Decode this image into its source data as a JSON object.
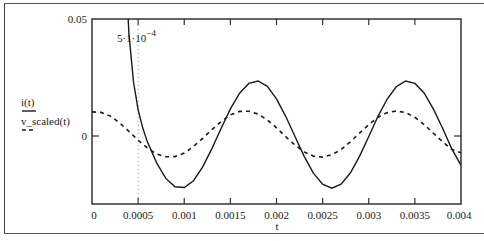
{
  "chart_data": {
    "type": "line",
    "title": "",
    "xlabel": "t",
    "ylabel": "",
    "xlim": [
      0,
      0.004
    ],
    "ylim": [
      -0.0294,
      0.05
    ],
    "grid": false,
    "legend_position": "left",
    "x_ticks": [
      {
        "value": 0,
        "label": "0"
      },
      {
        "value": 0.0005,
        "label": "0.0005"
      },
      {
        "value": 0.001,
        "label": "0.001"
      },
      {
        "value": 0.0015,
        "label": "0.0015"
      },
      {
        "value": 0.002,
        "label": "0.002"
      },
      {
        "value": 0.0025,
        "label": "0.0025"
      },
      {
        "value": 0.003,
        "label": "0.003"
      },
      {
        "value": 0.0035,
        "label": "0.0035"
      },
      {
        "value": 0.004,
        "label": "0.004"
      }
    ],
    "y_ticks": [
      {
        "value": 0.05,
        "label": "0.05"
      },
      {
        "value": 0,
        "label": "0"
      }
    ],
    "marker": {
      "t": 0.0005,
      "label_base": "5·1·10",
      "label_exp": "−4",
      "style": "dotted vertical line"
    },
    "series": [
      {
        "name": "i(t)",
        "style": "solid",
        "x": [
          0,
          0.0001,
          0.0002,
          0.0003,
          0.00035,
          0.0004,
          0.00045,
          0.0005,
          0.00055,
          0.0006,
          0.0007,
          0.0008,
          0.0009,
          0.001,
          0.0011,
          0.0012,
          0.0013,
          0.0014,
          0.0015,
          0.0016,
          0.0017,
          0.0018,
          0.0019,
          0.002,
          0.0021,
          0.0022,
          0.0023,
          0.0024,
          0.0025,
          0.0026,
          0.0027,
          0.0028,
          0.0029,
          0.003,
          0.0031,
          0.0032,
          0.0033,
          0.0034,
          0.0035,
          0.0036,
          0.0037,
          0.0038,
          0.0039,
          0.004
        ],
        "values": [
          17.2,
          3.56,
          0.75,
          0.168,
          0.0843,
          0.0438,
          0.0231,
          0.0113,
          0.0035,
          -0.0024,
          -0.0115,
          -0.0181,
          -0.0217,
          -0.022,
          -0.0191,
          -0.0132,
          -0.0054,
          0.0033,
          0.0116,
          0.0183,
          0.0225,
          0.0235,
          0.0212,
          0.0159,
          0.0084,
          -0.0002,
          -0.0087,
          -0.0159,
          -0.0206,
          -0.0223,
          -0.0206,
          -0.0158,
          -0.0087,
          -0.0002,
          0.0084,
          0.0158,
          0.0211,
          0.0235,
          0.0225,
          0.0184,
          0.0116,
          0.0033,
          -0.0055,
          -0.0125
        ]
      },
      {
        "name": "v_scaled(t)",
        "style": "dashed",
        "x": [
          0,
          0.0001,
          0.0002,
          0.0003,
          0.0004,
          0.0005,
          0.0006,
          0.0007,
          0.0008,
          0.0009,
          0.001,
          0.0011,
          0.0012,
          0.0013,
          0.0014,
          0.0015,
          0.0016,
          0.0017,
          0.0018,
          0.0019,
          0.002,
          0.0021,
          0.0022,
          0.0023,
          0.0024,
          0.0025,
          0.0026,
          0.0027,
          0.0028,
          0.0029,
          0.003,
          0.0031,
          0.0032,
          0.0033,
          0.0034,
          0.0035,
          0.0036,
          0.0037,
          0.0038,
          0.0039,
          0.004
        ],
        "values": [
          0.0103,
          0.0101,
          0.0085,
          0.0056,
          0.002,
          -0.0018,
          -0.0051,
          -0.0077,
          -0.0089,
          -0.0088,
          -0.0073,
          -0.0045,
          -0.001,
          0.0027,
          0.0062,
          0.009,
          0.0105,
          0.0106,
          0.0094,
          0.0069,
          0.0035,
          -0.0003,
          -0.0039,
          -0.0068,
          -0.0086,
          -0.009,
          -0.008,
          -0.0058,
          -0.0025,
          0.0012,
          0.0049,
          0.008,
          0.01,
          0.0107,
          0.01,
          0.008,
          0.0049,
          0.0012,
          -0.0025,
          -0.0057,
          -0.0072
        ]
      }
    ]
  },
  "legend": {
    "items": [
      {
        "label": "i(t)",
        "style": "solid"
      },
      {
        "label": "v_scaled(t)",
        "style": "dashed"
      }
    ]
  },
  "axes": {
    "x_label": "t",
    "y_top_label": "0.05",
    "y_zero_label": "0"
  },
  "colors": {
    "line": "#1a1a1a",
    "frame": "#333333",
    "marker": "#9a9a9a",
    "background": "#ffffff"
  }
}
